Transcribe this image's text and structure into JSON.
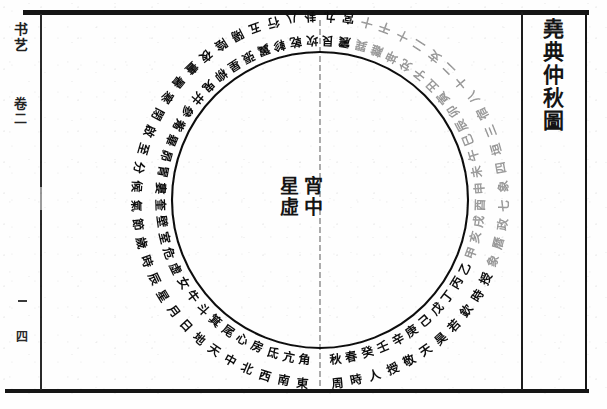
{
  "document": {
    "title": "堯典仲秋圖",
    "title_chars": [
      "堯",
      "典",
      "仲",
      "秋",
      "圖"
    ],
    "script_direction": "vertical-rtl",
    "ink_color": "#141414",
    "paper_color": "#fefefe"
  },
  "margin": {
    "top_label": "书艺",
    "volume_label": "卷二",
    "page_label": "四",
    "fold_mark": "—"
  },
  "center": {
    "right_column": "宵中",
    "left_column": "星虛",
    "right_column_chars": [
      "宵",
      "中"
    ],
    "left_column_chars": [
      "星",
      "虛"
    ]
  },
  "chart_data": {
    "type": "pie",
    "title": "堯典仲秋圖",
    "subtitle": "宵中星虛",
    "layout": {
      "center_x": 320,
      "center_y": 200,
      "inner_radius": 148,
      "mid_radius": 172,
      "outer_radius": 196,
      "grid": false,
      "legend": "none",
      "axis_line": "vertical-meridian"
    },
    "rings": [
      {
        "name": "inner-ring",
        "radius": 160,
        "font_size": 12,
        "note": "inner band of radially-set characters",
        "cells": [
          "角",
          "亢",
          "氐",
          "房",
          "心",
          "尾",
          "箕",
          "斗",
          "牛",
          "女",
          "虛",
          "危",
          "室",
          "壁",
          "奎",
          "婁",
          "胃",
          "昴",
          "畢",
          "觜",
          "參",
          "井",
          "鬼",
          "柳",
          "星",
          "張",
          "翼",
          "軫",
          "乾",
          "坎",
          "艮",
          "震",
          "巽",
          "離",
          "坤",
          "兌",
          "子",
          "丑",
          "寅",
          "卯",
          "辰",
          "巳",
          "午",
          "未",
          "申",
          "酉",
          "戌",
          "亥",
          "甲",
          "乙",
          "丙",
          "丁",
          "戊",
          "己",
          "庚",
          "辛",
          "壬",
          "癸",
          "春",
          "秋"
        ]
      },
      {
        "name": "outer-ring",
        "radius": 184,
        "font_size": 12,
        "note": "outer band of radially-set characters",
        "cells": [
          "東",
          "南",
          "西",
          "北",
          "中",
          "天",
          "地",
          "日",
          "月",
          "星",
          "辰",
          "時",
          "歲",
          "節",
          "氣",
          "候",
          "分",
          "至",
          "啟",
          "閉",
          "寒",
          "暑",
          "晝",
          "夜",
          "陰",
          "陽",
          "五",
          "行",
          "八",
          "卦",
          "九",
          "宮",
          "十",
          "干",
          "十",
          "二",
          "支",
          "二",
          "十",
          "八",
          "宿",
          "三",
          "垣",
          "四",
          "象",
          "七",
          "政",
          "曆",
          "象",
          "授",
          "時",
          "欽",
          "若",
          "昊",
          "天",
          "敬",
          "授",
          "人",
          "時",
          "周"
        ]
      }
    ],
    "trigram_markers": [
      {
        "label": "離",
        "angle_deg": 0,
        "ring": "outer",
        "note": "top of circle"
      },
      {
        "label": "坎",
        "angle_deg": 0,
        "ring": "inner",
        "note": "top of circle"
      }
    ],
    "meridian": {
      "label": "中線",
      "x": 320,
      "from_y": 20,
      "to_y": 388,
      "style": "dashed-faint"
    }
  }
}
